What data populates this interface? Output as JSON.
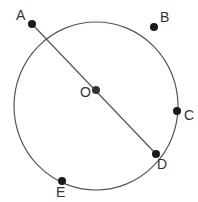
{
  "diagram": {
    "title": "",
    "circle": {
      "cx": 96,
      "cy": 105,
      "r": 84,
      "stroke": "#555555"
    },
    "diameter": {
      "from": "A",
      "to": "D"
    },
    "points": [
      {
        "label": "A",
        "x": 32,
        "y": 24,
        "lx": 16,
        "ly": 20
      },
      {
        "label": "B",
        "x": 154,
        "y": 27,
        "lx": 160,
        "ly": 22
      },
      {
        "label": "O",
        "x": 96,
        "y": 90,
        "lx": 79,
        "ly": 97
      },
      {
        "label": "C",
        "x": 177,
        "y": 111,
        "lx": 184,
        "ly": 120
      },
      {
        "label": "D",
        "x": 156,
        "y": 154,
        "lx": 158,
        "ly": 168
      },
      {
        "label": "E",
        "x": 62,
        "y": 181,
        "lx": 57,
        "ly": 197
      }
    ]
  }
}
